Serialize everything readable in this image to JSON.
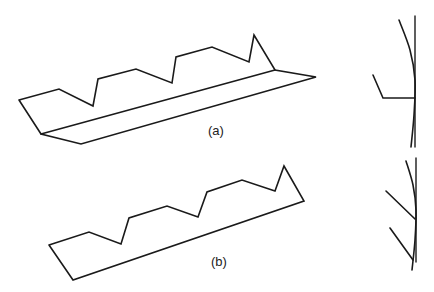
{
  "figure": {
    "panels": [
      {
        "id": "a",
        "label": "(a)",
        "label_pos": [
          208,
          124
        ],
        "profile": {
          "outline": [
            [
              19,
              100
            ],
            [
              59,
              89
            ],
            [
              93,
              106
            ],
            [
              98,
              79
            ],
            [
              136,
              69
            ],
            [
              172,
              83
            ],
            [
              176,
              57
            ],
            [
              212,
              47
            ],
            [
              249,
              62
            ],
            [
              254,
              35
            ],
            [
              275,
              70
            ],
            [
              316,
              77
            ],
            [
              81,
              144
            ],
            [
              41,
              134
            ],
            [
              19,
              100
            ]
          ],
          "inner_edge": [
            [
              41,
              134
            ],
            [
              275,
              70
            ]
          ]
        },
        "side_view": {
          "vertical": [
            [
              415,
              16
            ],
            [
              415,
              147
            ]
          ],
          "curve": [
            [
              399,
              20
            ],
            [
              410,
              50
            ],
            [
              415,
              80
            ],
            [
              414,
              115
            ],
            [
              411,
              147
            ]
          ],
          "arm": [
            [
              373,
              75
            ],
            [
              383,
              98
            ],
            [
              415,
              98
            ]
          ]
        }
      },
      {
        "id": "b",
        "label": "(b)",
        "label_pos": [
          211,
          255
        ],
        "profile": {
          "outline": [
            [
              49,
              245
            ],
            [
              89,
              232
            ],
            [
              121,
              244
            ],
            [
              129,
              218
            ],
            [
              167,
              206
            ],
            [
              198,
              217
            ],
            [
              207,
              192
            ],
            [
              242,
              180
            ],
            [
              275,
              191
            ],
            [
              284,
              166
            ],
            [
              304,
              201
            ],
            [
              73,
              280
            ],
            [
              49,
              245
            ]
          ]
        },
        "side_view": {
          "vertical": [
            [
              416,
              158
            ],
            [
              416,
              262
            ]
          ],
          "curve": [
            [
              406,
              161
            ],
            [
              413,
              185
            ],
            [
              416,
              210
            ],
            [
              415,
              240
            ],
            [
              412,
              270
            ]
          ],
          "branches": [
            [
              [
                386,
                191
              ],
              [
                415,
                219
              ]
            ],
            [
              [
                390,
                228
              ],
              [
                413,
                260
              ]
            ]
          ]
        }
      }
    ]
  }
}
